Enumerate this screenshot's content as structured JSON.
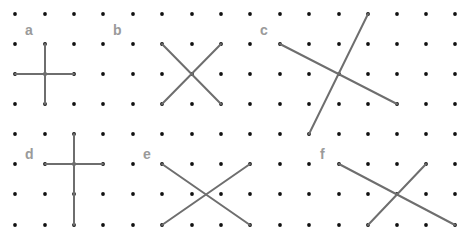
{
  "grid": {
    "columns_x": [
      15,
      45,
      74,
      103,
      133,
      162,
      192,
      221,
      250,
      280,
      309,
      339,
      368,
      397,
      426,
      455
    ],
    "rows_y": [
      14,
      44,
      74,
      104,
      134,
      164,
      194,
      225
    ],
    "dot_color": "#111111",
    "dot_radius": 1.9
  },
  "line_color": "#6e6e6e",
  "label_color": "#9a9a9a",
  "figures": [
    {
      "label": "a",
      "label_pos": [
        25,
        35
      ],
      "segments": [
        [
          45,
          44,
          45,
          104
        ],
        [
          15,
          74,
          74,
          74
        ]
      ]
    },
    {
      "label": "b",
      "label_pos": [
        113,
        35
      ],
      "segments": [
        [
          162,
          44,
          221,
          104
        ],
        [
          221,
          44,
          162,
          104
        ]
      ]
    },
    {
      "label": "c",
      "label_pos": [
        260,
        35
      ],
      "segments": [
        [
          280,
          44,
          397,
          104
        ],
        [
          368,
          14,
          309,
          134
        ]
      ]
    },
    {
      "label": "d",
      "label_pos": [
        25,
        159
      ],
      "segments": [
        [
          74,
          134,
          74,
          225
        ],
        [
          45,
          164,
          103,
          164
        ]
      ]
    },
    {
      "label": "e",
      "label_pos": [
        143,
        159
      ],
      "segments": [
        [
          162,
          164,
          250,
          225
        ],
        [
          162,
          225,
          250,
          164
        ]
      ]
    },
    {
      "label": "f",
      "label_pos": [
        320,
        159
      ],
      "segments": [
        [
          339,
          164,
          455,
          225
        ],
        [
          368,
          225,
          426,
          164
        ]
      ]
    }
  ]
}
